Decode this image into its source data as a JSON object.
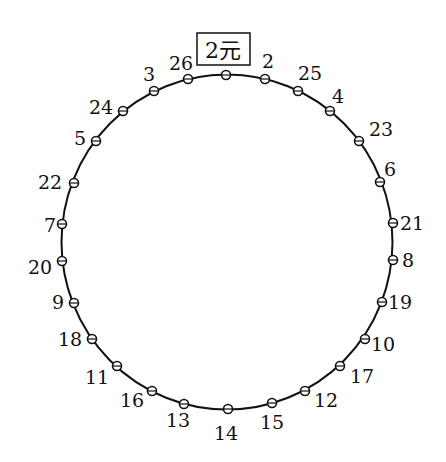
{
  "diagram": {
    "type": "circular-arrangement",
    "circle": {
      "cx": 227,
      "cy": 242,
      "rx": 165.5,
      "ry": 167.5,
      "stroke": "#111111"
    },
    "top_label": {
      "text": "2元",
      "x": 223,
      "y": 58,
      "box": {
        "x": 197,
        "y": 33,
        "w": 53,
        "h": 32
      }
    },
    "points": [
      {
        "label": "",
        "x": 226,
        "y": 75,
        "lx": 0,
        "ly": 0,
        "anchor": "middle"
      },
      {
        "label": "2",
        "x": 265,
        "y": 79,
        "lx": 268,
        "ly": 68,
        "anchor": "middle"
      },
      {
        "label": "25",
        "x": 298,
        "y": 91,
        "lx": 310,
        "ly": 80,
        "anchor": "middle"
      },
      {
        "label": "4",
        "x": 330,
        "y": 111,
        "lx": 338,
        "ly": 103,
        "anchor": "middle"
      },
      {
        "label": "23",
        "x": 359,
        "y": 141,
        "lx": 381,
        "ly": 136,
        "anchor": "middle"
      },
      {
        "label": "6",
        "x": 380,
        "y": 182,
        "lx": 390,
        "ly": 176,
        "anchor": "middle"
      },
      {
        "label": "21",
        "x": 393,
        "y": 223,
        "lx": 412,
        "ly": 230,
        "anchor": "middle"
      },
      {
        "label": "8",
        "x": 393,
        "y": 260,
        "lx": 408,
        "ly": 267,
        "anchor": "middle"
      },
      {
        "label": "19",
        "x": 382,
        "y": 302,
        "lx": 400,
        "ly": 309,
        "anchor": "middle"
      },
      {
        "label": "10",
        "x": 365,
        "y": 339,
        "lx": 383,
        "ly": 351,
        "anchor": "middle"
      },
      {
        "label": "17",
        "x": 340,
        "y": 366,
        "lx": 362,
        "ly": 383,
        "anchor": "middle"
      },
      {
        "label": "12",
        "x": 305,
        "y": 391,
        "lx": 326,
        "ly": 407,
        "anchor": "middle"
      },
      {
        "label": "15",
        "x": 272,
        "y": 403,
        "lx": 272,
        "ly": 429,
        "anchor": "middle"
      },
      {
        "label": "14",
        "x": 228,
        "y": 409,
        "lx": 226,
        "ly": 440,
        "anchor": "middle"
      },
      {
        "label": "13",
        "x": 184,
        "y": 404,
        "lx": 178,
        "ly": 427,
        "anchor": "middle"
      },
      {
        "label": "16",
        "x": 152,
        "y": 391,
        "lx": 132,
        "ly": 407,
        "anchor": "middle"
      },
      {
        "label": "11",
        "x": 117,
        "y": 366,
        "lx": 97,
        "ly": 384,
        "anchor": "middle"
      },
      {
        "label": "18",
        "x": 92,
        "y": 339,
        "lx": 70,
        "ly": 346,
        "anchor": "middle"
      },
      {
        "label": "9",
        "x": 74,
        "y": 303,
        "lx": 58,
        "ly": 309,
        "anchor": "middle"
      },
      {
        "label": "20",
        "x": 62,
        "y": 261,
        "lx": 40,
        "ly": 274,
        "anchor": "middle"
      },
      {
        "label": "7",
        "x": 62,
        "y": 224,
        "lx": 50,
        "ly": 232,
        "anchor": "middle"
      },
      {
        "label": "22",
        "x": 74,
        "y": 183,
        "lx": 50,
        "ly": 189,
        "anchor": "middle"
      },
      {
        "label": "5",
        "x": 96,
        "y": 141,
        "lx": 80,
        "ly": 145,
        "anchor": "middle"
      },
      {
        "label": "24",
        "x": 123,
        "y": 111,
        "lx": 101,
        "ly": 114,
        "anchor": "middle"
      },
      {
        "label": "3",
        "x": 154,
        "y": 91,
        "lx": 149,
        "ly": 81,
        "anchor": "middle"
      },
      {
        "label": "26",
        "x": 188,
        "y": 79,
        "lx": 181,
        "ly": 70,
        "anchor": "middle"
      }
    ]
  }
}
